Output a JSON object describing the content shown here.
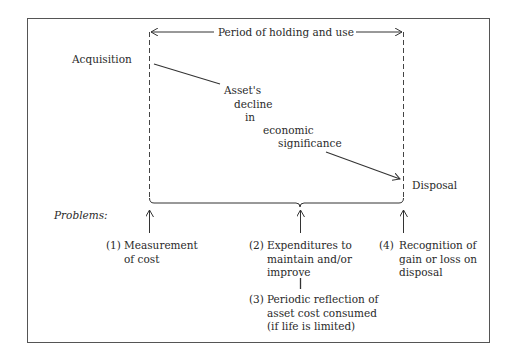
{
  "diagram": {
    "period_label": "Period of holding and use",
    "acquisition_label": "Acquisition",
    "disposal_label": "Disposal",
    "decline_label": [
      "Asset's",
      "decline",
      "in",
      "economic",
      "significance"
    ],
    "problems_label": "Problems:",
    "problems": [
      {
        "num": "(1)",
        "lines": [
          "Measurement",
          "of cost"
        ]
      },
      {
        "num": "(2)",
        "lines": [
          "Expenditures to",
          "maintain and/or",
          "improve"
        ]
      },
      {
        "num": "(3)",
        "lines": [
          "Periodic reflection of",
          "asset cost consumed",
          "(if life is limited)"
        ]
      },
      {
        "num": "(4)",
        "lines": [
          "Recognition of",
          "gain or loss on",
          "disposal"
        ]
      }
    ]
  },
  "colors": {
    "line": "#333333",
    "text": "#2a2a2a",
    "background": "#ffffff"
  }
}
